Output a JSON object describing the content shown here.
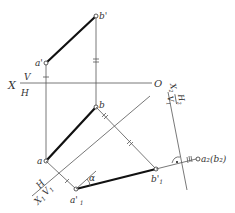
{
  "labels": {
    "b_prime": "b'",
    "a_prime": "a'",
    "b": "b",
    "a": "a",
    "x": "X",
    "v": "V",
    "h": "H",
    "o": "O",
    "x1": "X",
    "x1_sub": "1",
    "h_new": "H",
    "v1": "V",
    "v1_sub": "1",
    "a1_prime": "a'",
    "a1_prime_sub": "1",
    "b1_prime": "b'",
    "b1_prime_sub": "1",
    "alpha": "α",
    "x2": "X",
    "x2_sub": "2",
    "h2": "H",
    "h2_sub": "2",
    "v1b": "V",
    "v1b_sub": "1",
    "a2b2": "a₂(b₂)"
  },
  "colors": {
    "thin_line": "#555555",
    "thick_line": "#111111",
    "text": "#333333"
  }
}
